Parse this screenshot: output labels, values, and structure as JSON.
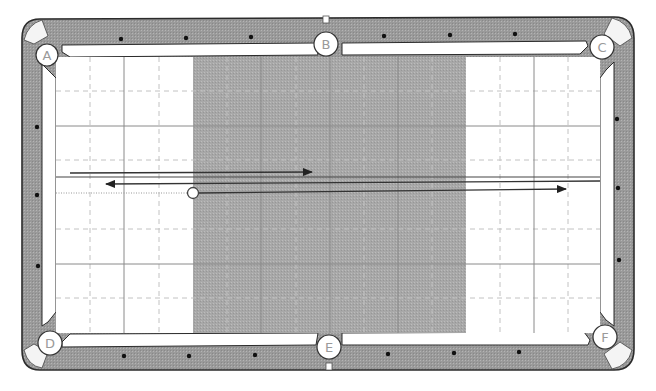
{
  "diagram": {
    "type": "billiard-table",
    "colors": {
      "rail": "#9e9e9e",
      "rail_outline": "#2b2b2b",
      "cushion": "#ffffff",
      "cloth": "#ffffff",
      "shaded_zone": "#a6a6a6",
      "grid_solid": "#8c8c8c",
      "grid_dashed": "#c4c4c4",
      "path_line": "#333333",
      "diamond": "#111111",
      "ball_fill": "#ffffff",
      "ball_stroke": "#444444",
      "pocket_label": "#9a9a9a"
    },
    "pockets": [
      {
        "id": "A",
        "label": "A",
        "position": "top-left"
      },
      {
        "id": "B",
        "label": "B",
        "position": "top-middle"
      },
      {
        "id": "C",
        "label": "C",
        "position": "top-right"
      },
      {
        "id": "D",
        "label": "D",
        "position": "bottom-left"
      },
      {
        "id": "E",
        "label": "E",
        "position": "bottom-middle"
      },
      {
        "id": "F",
        "label": "F",
        "position": "bottom-right"
      }
    ],
    "shaded_zone": {
      "from_diamond": 2,
      "to_diamond": 6,
      "description": "center band of table shaded"
    },
    "ball": {
      "label": "cue-ball",
      "x_diamond": 2,
      "y_diamond": 2.0
    },
    "paths": [
      {
        "name": "dotted-approach",
        "style": "dotted",
        "direction": "none"
      },
      {
        "name": "long-right-arrow",
        "style": "solid",
        "direction": "right"
      },
      {
        "name": "reference-line",
        "style": "solid",
        "direction": "none"
      },
      {
        "name": "short-right-arrow",
        "style": "solid",
        "direction": "right"
      },
      {
        "name": "left-arrow",
        "style": "solid",
        "direction": "left"
      }
    ]
  }
}
